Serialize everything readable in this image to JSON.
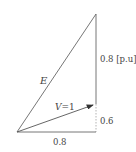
{
  "diagram": {
    "type": "phasor-diagram",
    "labels": {
      "e": "E",
      "v_var": "V",
      "v_eq": "=1",
      "vertical_top": "0.8 [p.u]",
      "vertical_bottom": "0.6",
      "horizontal": "0.8"
    },
    "colors": {
      "line": "#666666",
      "dotted": "#aaaaaa",
      "text": "#444444",
      "background": "#ffffff"
    },
    "points": {
      "origin": [
        17,
        132
      ],
      "top_vertex": [
        96,
        14
      ],
      "bottom_right": [
        96,
        132
      ],
      "v_tip": [
        93,
        105
      ]
    }
  }
}
